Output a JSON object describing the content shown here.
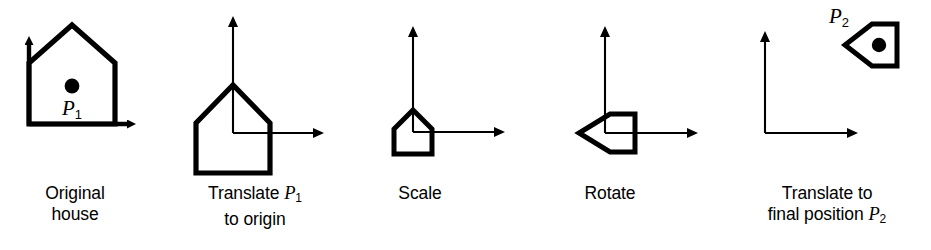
{
  "figure": {
    "stroke_color": "#000000",
    "background_color": "#ffffff",
    "panel_count": 5
  },
  "panels": [
    {
      "id": "original-house",
      "caption_line1": "Original",
      "caption_line2": "house",
      "caption_full": "Original house",
      "point_label": "P",
      "point_subscript": "1",
      "has_point_marker": true,
      "axes": {
        "style": "bold",
        "origin_x": 29,
        "origin_y": 124
      },
      "shape": {
        "type": "house",
        "rotation_deg": 0,
        "scale": 1.0,
        "line_weight": "bold"
      }
    },
    {
      "id": "translate-to-origin",
      "caption_line1_pre": "Translate ",
      "caption_line1_var": "P",
      "caption_line1_sub": "1",
      "caption_line2": "to origin",
      "caption_full": "Translate P1 to origin",
      "has_point_marker": false,
      "axes": {
        "style": "thin",
        "origin_x": 233,
        "origin_y": 133
      },
      "shape": {
        "type": "house",
        "rotation_deg": 0,
        "scale": 1.0,
        "line_weight": "bold"
      }
    },
    {
      "id": "scale",
      "caption_line1": "Scale",
      "caption_full": "Scale",
      "has_point_marker": false,
      "axes": {
        "style": "thin",
        "origin_x": 413,
        "origin_y": 132
      },
      "shape": {
        "type": "house",
        "rotation_deg": 0,
        "scale": 0.5,
        "line_weight": "bold"
      }
    },
    {
      "id": "rotate",
      "caption_line1": "Rotate",
      "caption_full": "Rotate",
      "has_point_marker": false,
      "axes": {
        "style": "thin",
        "origin_x": 605,
        "origin_y": 133
      },
      "shape": {
        "type": "house",
        "rotation_deg": 90,
        "scale": 0.5,
        "line_weight": "bold"
      }
    },
    {
      "id": "translate-final",
      "caption_line1": "Translate to",
      "caption_line2_pre": "final position ",
      "caption_line2_var": "P",
      "caption_line2_sub": "2",
      "caption_full": "Translate to final position P2",
      "point_label": "P",
      "point_subscript": "2",
      "has_point_marker": true,
      "axes": {
        "style": "thin",
        "origin_x": 765,
        "origin_y": 133
      },
      "shape": {
        "type": "house",
        "rotation_deg": 90,
        "scale": 0.5,
        "line_weight": "bold"
      }
    }
  ]
}
